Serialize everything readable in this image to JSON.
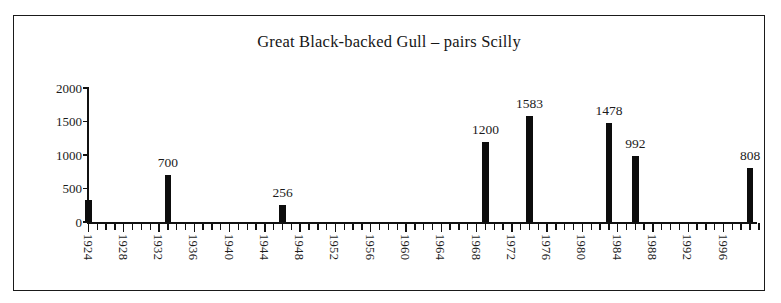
{
  "chart_data": {
    "type": "bar",
    "title": "Great Black-backed Gull – pairs Scilly",
    "xlabel": "",
    "ylabel": "",
    "ylim": [
      0,
      2000
    ],
    "xlim": [
      1924,
      2000
    ],
    "grid": false,
    "legend": null,
    "y_ticks": [
      0,
      500,
      1000,
      1500,
      2000
    ],
    "y_tick_labels": [
      "0",
      "500",
      "1000",
      "1500",
      "2000"
    ],
    "x_tick_labels": [
      "1924",
      "1928",
      "1932",
      "1936",
      "1940",
      "1944",
      "1948",
      "1952",
      "1956",
      "1960",
      "1964",
      "1968",
      "1972",
      "1976",
      "1980",
      "1984",
      "1988",
      "1992",
      "1996"
    ],
    "x_tick_label_years": [
      1924,
      1928,
      1932,
      1936,
      1940,
      1944,
      1948,
      1952,
      1956,
      1960,
      1964,
      1968,
      1972,
      1976,
      1980,
      1984,
      1988,
      1992,
      1996
    ],
    "x_tick_step_years": 1,
    "x_tick_label_step_years": 4,
    "bar_color": "#0d0d0d",
    "categories": [
      1924,
      1933,
      1946,
      1969,
      1974,
      1983,
      1986,
      1999
    ],
    "values": [
      330,
      700,
      256,
      1200,
      1583,
      1478,
      992,
      808
    ],
    "bars": [
      {
        "year": 1924,
        "value": 330,
        "label": ""
      },
      {
        "year": 1933,
        "value": 700,
        "label": "700"
      },
      {
        "year": 1946,
        "value": 256,
        "label": "256"
      },
      {
        "year": 1969,
        "value": 1200,
        "label": "1200"
      },
      {
        "year": 1974,
        "value": 1583,
        "label": "1583"
      },
      {
        "year": 1983,
        "value": 1478,
        "label": "1478"
      },
      {
        "year": 1986,
        "value": 992,
        "label": "992"
      },
      {
        "year": 1999,
        "value": 808,
        "label": "808"
      }
    ]
  }
}
